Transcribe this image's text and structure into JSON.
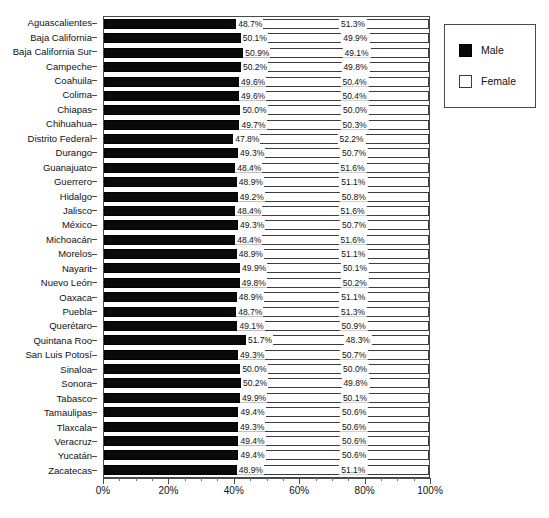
{
  "chart_data": {
    "type": "bar",
    "subtype": "stacked-horizontal-100",
    "title": "",
    "xlabel": "",
    "ylabel": "",
    "xlim": [
      0,
      100
    ],
    "xticks": [
      0,
      20,
      40,
      60,
      80,
      100
    ],
    "xtick_labels": [
      "0%",
      "20%",
      "40%",
      "60%",
      "80%",
      "100%"
    ],
    "xtick_minor_step": 5,
    "grid": false,
    "legend_position": "right",
    "value_suffix": "%",
    "legend": [
      {
        "name": "Male",
        "color": "#0a0a0a",
        "swatch": "swatch-male"
      },
      {
        "name": "Female",
        "color": "#ffffff",
        "swatch": "swatch-female"
      }
    ],
    "categories": [
      "Aguascalientes",
      "Baja California",
      "Baja California Sur",
      "Campeche",
      "Coahuila",
      "Colima",
      "Chiapas",
      "Chihuahua",
      "Distrito Federal",
      "Durango",
      "Guanajuato",
      "Guerrero",
      "Hidalgo",
      "Jalisco",
      "México",
      "Michoacán",
      "Morelos",
      "Nayarit",
      "Nuevo León",
      "Oaxaca",
      "Puebla",
      "Querétaro",
      "Quintana Roo",
      "San Luis Potosí",
      "Sinaloa",
      "Sonora",
      "Tabasco",
      "Tamaulipas",
      "Tlaxcala",
      "Veracruz",
      "Yucatán",
      "Zacatecas"
    ],
    "series": [
      {
        "name": "Male",
        "values": [
          48.7,
          50.1,
          50.9,
          50.2,
          49.6,
          49.6,
          50.0,
          49.7,
          47.8,
          49.3,
          48.4,
          48.9,
          49.2,
          48.4,
          49.3,
          48.4,
          48.9,
          49.9,
          49.8,
          48.9,
          48.7,
          49.1,
          51.7,
          49.3,
          50.0,
          50.2,
          49.9,
          49.4,
          49.3,
          49.4,
          49.4,
          48.9
        ],
        "labels": [
          "48.7%",
          "50.1%",
          "50.9%",
          "50.2%",
          "49.6%",
          "49.6%",
          "50.0%",
          "49.7%",
          "47.8%",
          "49.3%",
          "48.4%",
          "48.9%",
          "49.2%",
          "48.4%",
          "49.3%",
          "48.4%",
          "48.9%",
          "49.9%",
          "49.8%",
          "48.9%",
          "48.7%",
          "49.1%",
          "51.7%",
          "49.3%",
          "50.0%",
          "50.2%",
          "49.9%",
          "49.4%",
          "49.3%",
          "49.4%",
          "49.4%",
          "48.9%"
        ]
      },
      {
        "name": "Female",
        "values": [
          51.3,
          49.9,
          49.1,
          49.8,
          50.4,
          50.4,
          50.0,
          50.3,
          52.2,
          50.7,
          51.6,
          51.1,
          50.8,
          51.6,
          50.7,
          51.6,
          51.1,
          50.1,
          50.2,
          51.1,
          51.3,
          50.9,
          48.3,
          50.7,
          50.0,
          49.8,
          50.1,
          50.6,
          50.7,
          50.6,
          50.6,
          51.1
        ],
        "labels": [
          "51.3%",
          "49.9%",
          "49.1%",
          "49.8%",
          "50.4%",
          "50.4%",
          "50.0%",
          "50.3%",
          "52.2%",
          "50.7%",
          "51.6%",
          "51.1%",
          "50.8%",
          "51.6%",
          "50.7%",
          "51.6%",
          "51.1%",
          "50.1%",
          "50.2%",
          "51.1%",
          "51.3%",
          "50.9%",
          "48.3%",
          "50.7%",
          "50.0%",
          "49.8%",
          "50.1%",
          "50.6%",
          "50.6%",
          "50.6%",
          "50.6%",
          "51.1%"
        ]
      }
    ]
  }
}
